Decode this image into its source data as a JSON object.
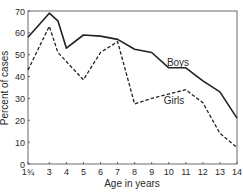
{
  "chart_data": {
    "type": "line",
    "title": "",
    "xlabel": "Age in years",
    "ylabel": "Percent of cases",
    "xlim": [
      1.75,
      14
    ],
    "ylim": [
      0,
      70
    ],
    "x_ticks": [
      {
        "value": 1.75,
        "label": "1¾"
      },
      {
        "value": 3,
        "label": "3"
      },
      {
        "value": 4,
        "label": "4"
      },
      {
        "value": 5,
        "label": "5"
      },
      {
        "value": 6,
        "label": "6"
      },
      {
        "value": 7,
        "label": "7"
      },
      {
        "value": 8,
        "label": "8"
      },
      {
        "value": 9,
        "label": "9"
      },
      {
        "value": 10,
        "label": "10"
      },
      {
        "value": 11,
        "label": "11"
      },
      {
        "value": 12,
        "label": "12"
      },
      {
        "value": 13,
        "label": "13"
      },
      {
        "value": 14,
        "label": "14"
      }
    ],
    "y_ticks": [
      0,
      10,
      20,
      30,
      40,
      50,
      60,
      70
    ],
    "grid": false,
    "legend": "inline labels",
    "series": [
      {
        "name": "Boys",
        "style": "solid",
        "color": "#222222",
        "label_pos": {
          "x": 11.6,
          "y": 27.5
        },
        "points": [
          [
            1.75,
            58
          ],
          [
            3,
            69
          ],
          [
            3.5,
            65.5
          ],
          [
            4,
            53
          ],
          [
            5,
            59
          ],
          [
            6,
            58.5
          ],
          [
            7,
            57
          ],
          [
            8,
            52.5
          ],
          [
            9,
            51
          ],
          [
            10,
            44
          ],
          [
            11,
            44
          ],
          [
            12,
            38
          ],
          [
            13,
            33
          ],
          [
            14,
            21
          ]
        ]
      },
      {
        "name": "Girls",
        "style": "dashed",
        "color": "#222222",
        "label_pos": {
          "x": 9.0,
          "y": 26.5
        },
        "points": [
          [
            1.75,
            43
          ],
          [
            3,
            63
          ],
          [
            3.5,
            51
          ],
          [
            5,
            38.5
          ],
          [
            6,
            51
          ],
          [
            7,
            56
          ],
          [
            8,
            27.5
          ],
          [
            9,
            30
          ],
          [
            11,
            34
          ],
          [
            12,
            28
          ],
          [
            13,
            14
          ],
          [
            14,
            7.5
          ]
        ]
      }
    ]
  }
}
